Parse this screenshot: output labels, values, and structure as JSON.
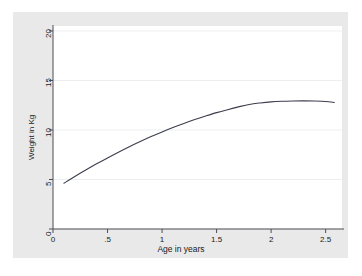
{
  "chart_data": {
    "type": "line",
    "title": "",
    "subtitle": "",
    "xlabel": "Age in years",
    "ylabel": "Weight in Kg",
    "xlim": [
      0,
      2.65
    ],
    "ylim": [
      0,
      20.5
    ],
    "xticks": [
      "0",
      ".5",
      "1",
      "1.5",
      "2",
      "2.5"
    ],
    "xtick_values": [
      0,
      0.5,
      1,
      1.5,
      2,
      2.5
    ],
    "yticks": [
      "0",
      "5",
      "10",
      "15",
      "20"
    ],
    "ytick_values": [
      0,
      5,
      10,
      15,
      20
    ],
    "grid": "horizontal",
    "legend": "none",
    "series": [
      {
        "name": "Weight-for-age curve",
        "color": "#3d3d4d",
        "x": [
          0.1,
          0.2,
          0.3,
          0.4,
          0.5,
          0.6,
          0.7,
          0.8,
          0.9,
          1.0,
          1.1,
          1.2,
          1.3,
          1.4,
          1.5,
          1.6,
          1.7,
          1.8,
          1.9,
          2.0,
          2.1,
          2.2,
          2.3,
          2.4,
          2.5,
          2.58
        ],
        "y": [
          4.62,
          5.3,
          5.95,
          6.58,
          7.18,
          7.76,
          8.31,
          8.83,
          9.33,
          9.8,
          10.24,
          10.66,
          11.05,
          11.41,
          11.75,
          12.05,
          12.33,
          12.58,
          12.73,
          12.84,
          12.9,
          12.93,
          12.94,
          12.92,
          12.87,
          12.78
        ]
      }
    ],
    "axis_color": "#4d4d55",
    "gridline_color": "#eceff1",
    "plot_background": "#ffffff",
    "graph_background": "#e9e9e9"
  }
}
